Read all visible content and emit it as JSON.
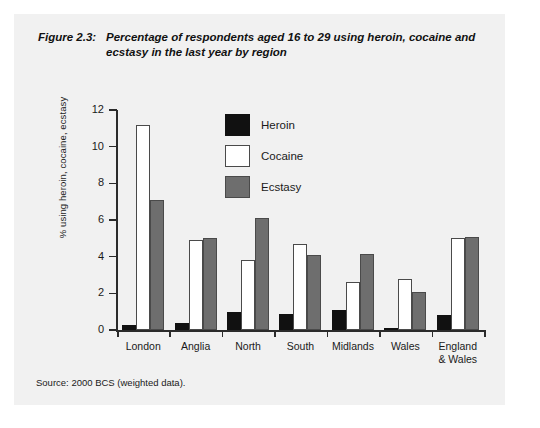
{
  "figure": {
    "number": "Figure 2.3:",
    "title": "Percentage of respondents aged 16 to 29 using heroin, cocaine and ecstasy in the last year by region",
    "source": "Source:  2000 BCS (weighted data)."
  },
  "chart_data": {
    "type": "bar",
    "title": "Percentage of respondents aged 16 to 29 using heroin, cocaine and ecstasy in the last year by region",
    "xlabel": "",
    "ylabel": "% using heroin, cocaine, ecstasy",
    "ylim": [
      0,
      12
    ],
    "yticks": [
      0,
      2,
      4,
      6,
      8,
      10,
      12
    ],
    "ytick_labels": [
      "0",
      "2",
      "4",
      "6",
      "8",
      "10",
      "12"
    ],
    "grid": false,
    "legend_position": "upper-center",
    "categories": [
      "London",
      "Anglia",
      "North",
      "South",
      "Midlands",
      "Wales",
      "England\n& Wales"
    ],
    "series": [
      {
        "name": "Heroin",
        "color": "#111111",
        "values": [
          0.3,
          0.4,
          1.0,
          0.9,
          1.1,
          0.05,
          0.8
        ]
      },
      {
        "name": "Cocaine",
        "color": "#ffffff",
        "values": [
          11.2,
          4.9,
          3.8,
          4.7,
          2.6,
          2.8,
          5.0
        ]
      },
      {
        "name": "Ecstasy",
        "color": "#6e6e6e",
        "values": [
          7.1,
          5.0,
          6.1,
          4.1,
          4.15,
          2.1,
          5.1
        ]
      }
    ]
  }
}
